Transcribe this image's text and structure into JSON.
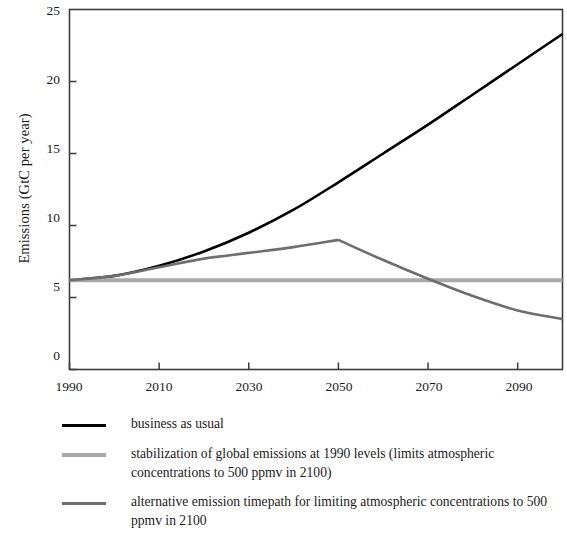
{
  "chart_data": {
    "type": "line",
    "title": "",
    "xlabel": "",
    "ylabel": "Emissions (GtC per year)",
    "xlim": [
      1990,
      2100
    ],
    "ylim": [
      0,
      25
    ],
    "grid": false,
    "legend_position": "below",
    "xticks": [
      1990,
      2010,
      2030,
      2050,
      2070,
      2090
    ],
    "yticks": [
      0,
      5,
      10,
      15,
      20,
      25
    ],
    "series": [
      {
        "name": "business as usual",
        "color": "#000000",
        "width": 2.6,
        "x": [
          1990,
          2000,
          2010,
          2020,
          2030,
          2040,
          2050,
          2060,
          2070,
          2080,
          2090,
          2100
        ],
        "values": [
          6.2,
          6.5,
          7.2,
          8.2,
          9.5,
          11.1,
          13.0,
          15.0,
          17.0,
          19.1,
          21.2,
          23.3
        ]
      },
      {
        "name": "stabilization of global emissions at 1990 levels (limits atmospheric concentrations to 500 ppmv in 2100)",
        "color": "#a9a9a9",
        "width": 4.0,
        "x": [
          1990,
          2100
        ],
        "values": [
          6.2,
          6.2
        ]
      },
      {
        "name": "alternative emission timepath for limiting atmospheric concentrations to 500 ppmv in 2100",
        "color": "#6e6e6e",
        "width": 2.6,
        "x": [
          1990,
          2000,
          2010,
          2020,
          2030,
          2040,
          2050,
          2060,
          2070,
          2080,
          2090,
          2100
        ],
        "values": [
          6.2,
          6.5,
          7.1,
          7.7,
          8.1,
          8.5,
          9.0,
          7.6,
          6.3,
          5.1,
          4.1,
          3.5
        ]
      }
    ]
  },
  "axis": {
    "y_title": "Emissions (GtC per year)",
    "y_ticks": [
      "25",
      "20",
      "15",
      "10",
      "5",
      "0"
    ],
    "x_ticks": [
      "1990",
      "2010",
      "2030",
      "2050",
      "2070",
      "2090"
    ]
  },
  "legend": {
    "entries": [
      {
        "label": "business as usual",
        "color": "#000000"
      },
      {
        "label": "stabilization of global emissions at 1990 levels (limits atmospheric concentrations to 500 ppmv in 2100)",
        "color": "#a9a9a9"
      },
      {
        "label": "alternative emission timepath for limiting atmospheric concentrations to 500 ppmv in 2100",
        "color": "#6e6e6e"
      }
    ]
  },
  "colors": {
    "frame": "#3c3c3c",
    "text": "#1a1a1a",
    "background": "#ffffff"
  }
}
